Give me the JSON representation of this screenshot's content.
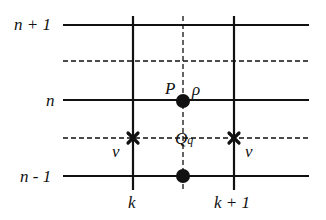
{
  "diagram": {
    "type": "staggered-grid",
    "colors": {
      "line": "#111111",
      "background": "#ffffff"
    },
    "row_labels": [
      {
        "text": "n + 1",
        "y": 25
      },
      {
        "text": "n",
        "y": 100
      },
      {
        "text": "n - 1",
        "y": 176
      }
    ],
    "col_labels": [
      {
        "text": "k",
        "x": 133
      },
      {
        "text": "k + 1",
        "x": 234
      }
    ],
    "solid_horizontal_y": [
      25,
      100,
      176
    ],
    "dashed_horizontal_y": [
      61,
      138
    ],
    "solid_vertical_x": [
      133,
      234
    ],
    "dashed_vertical_x": [
      183
    ],
    "points": {
      "P": {
        "label": "P",
        "var": "ρ",
        "x": 183,
        "y": 101
      },
      "lower": {
        "x": 183,
        "y": 176
      }
    },
    "midpoint": {
      "label": "Q",
      "subscript": "q",
      "x": 183,
      "y": 138
    },
    "velocity_nodes": [
      {
        "label": "v",
        "x": 133,
        "y": 138
      },
      {
        "label": "v",
        "x": 234,
        "y": 138
      }
    ]
  }
}
